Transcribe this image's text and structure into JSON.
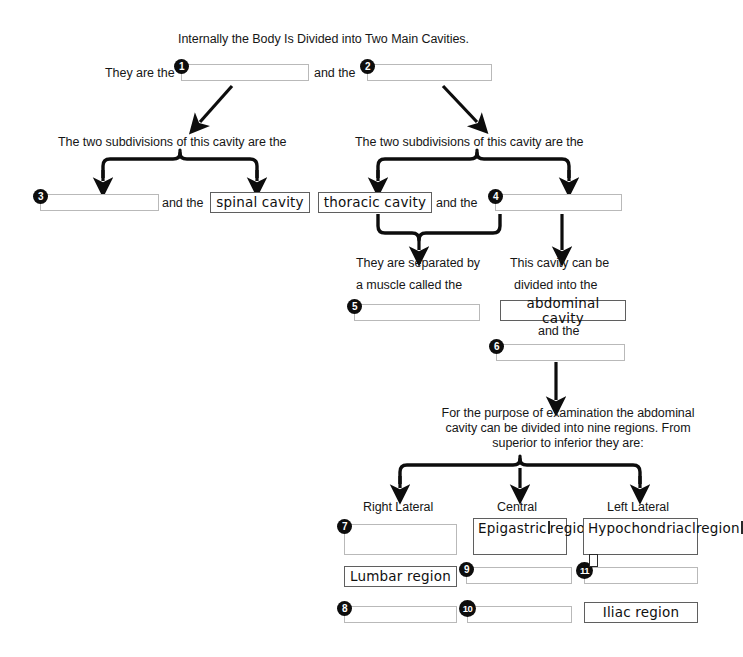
{
  "title": "Internally the Body Is Divided into Two Main Cavities.",
  "prompts": {
    "they_are_the": "They are the",
    "and_the": "and the",
    "left_branch": "The two subdivisions of this cavity are the",
    "right_branch": "The two subdivisions of this cavity are the",
    "separated_line1": "They are separated by",
    "separated_line2": "a muscle called the",
    "divided_line1": "This cavity can be",
    "divided_line2": "divided into the",
    "and_the_2": "and the",
    "nine_regions": "For the purpose of examination the abdominal\ncavity can be divided into nine regions. From\nsuperior to inferior they are:"
  },
  "columns": {
    "right_lateral": "Right Lateral",
    "central": "Central",
    "left_lateral": "Left Lateral"
  },
  "answers": {
    "a1": {
      "number": "1",
      "value": "",
      "filled": false
    },
    "a2": {
      "number": "2",
      "value": "",
      "filled": false
    },
    "a3": {
      "number": "3",
      "value": "",
      "filled": false
    },
    "spinal": {
      "number": "",
      "value": "spinal cavity",
      "filled": true
    },
    "thoracic": {
      "number": "",
      "value": "thoracic cavity",
      "filled": true
    },
    "a4": {
      "number": "4",
      "value": "",
      "filled": false
    },
    "a5": {
      "number": "5",
      "value": "",
      "filled": false
    },
    "abdominal": {
      "number": "",
      "value": "abdominal cavity",
      "filled": true
    },
    "a6": {
      "number": "6",
      "value": "",
      "filled": false
    },
    "a7": {
      "number": "7",
      "value": "",
      "filled": false
    },
    "epigastric": {
      "number": "",
      "value": "Epigastric",
      "value2": "region",
      "filled": true
    },
    "hypochondriac": {
      "number": "",
      "value": "Hypochondriacl",
      "value2": "region",
      "filled": true
    },
    "lumbar": {
      "number": "",
      "value": "Lumbar region",
      "filled": true
    },
    "a9": {
      "number": "9",
      "value": "",
      "filled": false
    },
    "a11": {
      "number": "11",
      "value": "",
      "filled": false
    },
    "a8": {
      "number": "8",
      "value": "",
      "filled": false
    },
    "a10": {
      "number": "10",
      "value": "",
      "filled": false
    },
    "iliac": {
      "number": "",
      "value": "Iliac region",
      "filled": true
    }
  },
  "colors": {
    "ink": "#161616",
    "arrow": "#0d0d0d",
    "blank_border": "#b9b9b9",
    "filled_border": "#5f5f5f",
    "bullet_bg": "#0d0d0d",
    "bullet_fg": "#ffffff",
    "background": "#ffffff"
  }
}
